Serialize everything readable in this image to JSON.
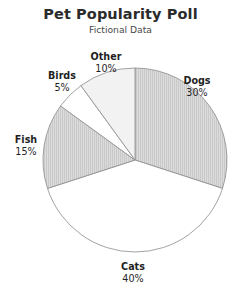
{
  "chart_data": {
    "type": "pie",
    "title": "Pet Popularity Poll",
    "subtitle": "Fictional Data",
    "categories": [
      "Dogs",
      "Cats",
      "Fish",
      "Birds",
      "Other"
    ],
    "values": [
      30,
      40,
      15,
      5,
      10
    ],
    "value_labels": [
      "30%",
      "40%",
      "15%",
      "5%",
      "10%"
    ],
    "unit": "percent",
    "total": 100,
    "start_angle_deg": 0,
    "direction": "clockwise",
    "legend": "none",
    "grid": false,
    "slices": [
      {
        "name": "Dogs",
        "value": 30,
        "value_label": "30%",
        "fill": "#d4d4d4",
        "hatch": "vertical-lines",
        "edge": "#8c8c8c",
        "label_x": 197,
        "label_y": 84,
        "anchor": "middle"
      },
      {
        "name": "Cats",
        "value": 40,
        "value_label": "40%",
        "fill": "#ffffff",
        "hatch": "none",
        "edge": "#8c8c8c",
        "label_x": 133,
        "label_y": 270,
        "anchor": "middle"
      },
      {
        "name": "Fish",
        "value": 15,
        "value_label": "15%",
        "fill": "#d4d4d4",
        "hatch": "vertical-lines",
        "edge": "#8c8c8c",
        "label_x": 26,
        "label_y": 143,
        "anchor": "middle"
      },
      {
        "name": "Birds",
        "value": 5,
        "value_label": "5%",
        "fill": "#ffffff",
        "hatch": "none",
        "edge": "#8c8c8c",
        "label_x": 62,
        "label_y": 79,
        "anchor": "middle"
      },
      {
        "name": "Other",
        "value": 10,
        "value_label": "10%",
        "fill": "#f2f2f2",
        "hatch": "none",
        "edge": "#8c8c8c",
        "label_x": 106,
        "label_y": 60,
        "anchor": "middle"
      }
    ],
    "geometry": {
      "center_x": 135,
      "center_y": 160,
      "radius": 92
    },
    "colors": {
      "background": "#ffffff",
      "title": "#2b2b2b",
      "subtitle": "#4a4a4a",
      "label": "#1f1f1f",
      "edge": "#8c8c8c",
      "shaded": "#d4d4d4",
      "light": "#f2f2f2",
      "plain": "#ffffff"
    }
  }
}
